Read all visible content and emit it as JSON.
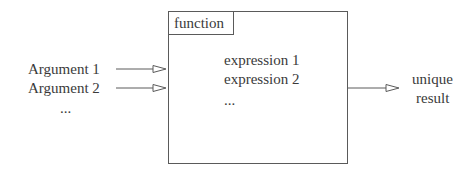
{
  "diagram": {
    "function_label": "function",
    "arguments": [
      "Argument 1",
      "Argument 2",
      "..."
    ],
    "expressions": [
      "expression 1",
      "expression 2",
      "..."
    ],
    "output": {
      "line1": "unique",
      "line2": "result"
    }
  },
  "colors": {
    "stroke": "#5a5a5a",
    "text": "#3a3a3a",
    "background": "#ffffff"
  }
}
